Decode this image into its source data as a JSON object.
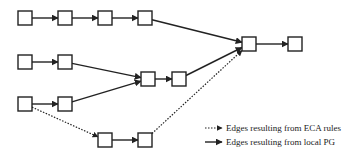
{
  "diagram": {
    "stroke_color": "#222222",
    "nodes": [
      {
        "id": "r1n1",
        "x": 18,
        "y": 11
      },
      {
        "id": "r1n2",
        "x": 58,
        "y": 11
      },
      {
        "id": "r1n3",
        "x": 98,
        "y": 11
      },
      {
        "id": "r1n4",
        "x": 138,
        "y": 11
      },
      {
        "id": "r2n1",
        "x": 18,
        "y": 55
      },
      {
        "id": "r2n2",
        "x": 58,
        "y": 55
      },
      {
        "id": "m1",
        "x": 141,
        "y": 72
      },
      {
        "id": "m2",
        "x": 172,
        "y": 72
      },
      {
        "id": "r3n1",
        "x": 18,
        "y": 97
      },
      {
        "id": "r3n2",
        "x": 58,
        "y": 97
      },
      {
        "id": "r4n1",
        "x": 98,
        "y": 133
      },
      {
        "id": "r4n2",
        "x": 138,
        "y": 133
      },
      {
        "id": "hub",
        "x": 242,
        "y": 37
      },
      {
        "id": "out",
        "x": 288,
        "y": 37
      }
    ],
    "edges": [
      {
        "from": "r1n1",
        "to": "r1n2",
        "type": "local-pg"
      },
      {
        "from": "r1n2",
        "to": "r1n3",
        "type": "local-pg"
      },
      {
        "from": "r1n3",
        "to": "r1n4",
        "type": "local-pg"
      },
      {
        "from": "r1n4",
        "to": "hub",
        "type": "local-pg"
      },
      {
        "from": "r2n1",
        "to": "r2n2",
        "type": "local-pg"
      },
      {
        "from": "r2n2",
        "to": "m1",
        "type": "local-pg"
      },
      {
        "from": "r3n1",
        "to": "r3n2",
        "type": "local-pg"
      },
      {
        "from": "r3n2",
        "to": "m1",
        "type": "local-pg"
      },
      {
        "from": "m1",
        "to": "m2",
        "type": "local-pg"
      },
      {
        "from": "m2",
        "to": "hub",
        "type": "local-pg"
      },
      {
        "from": "r3n1",
        "to": "r4n1",
        "type": "eca"
      },
      {
        "from": "r4n1",
        "to": "r4n2",
        "type": "local-pg"
      },
      {
        "from": "r4n2",
        "to": "hub",
        "type": "eca"
      },
      {
        "from": "hub",
        "to": "out",
        "type": "local-pg"
      }
    ]
  },
  "legend": {
    "items": [
      {
        "type": "eca",
        "label": "Edges resulting from ECA rules"
      },
      {
        "type": "local-pg",
        "label": "Edges resulting from local PG"
      }
    ]
  }
}
